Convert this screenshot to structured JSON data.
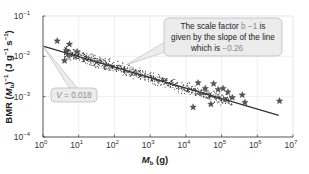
{
  "chart_data": {
    "type": "scatter",
    "title": "",
    "xlabel": "M_b (g)",
    "xlabel_parts": {
      "main": "M",
      "sub": "b",
      "unit": " (g)"
    },
    "ylabel": "BMR (M_b)^-1 (J g^-1 s^-1)",
    "ylabel_parts": {
      "a": "BMR (",
      "m": "M",
      "sub": "b",
      "b": ")",
      "exp1": "−1",
      "c": " (J g",
      "exp2": "−1",
      "d": " s",
      "exp3": "−1",
      "e": ")"
    },
    "x_scale": "log",
    "y_scale": "log",
    "xlim": [
      1,
      10000000
    ],
    "ylim": [
      0.0001,
      0.1
    ],
    "x_ticks": [
      {
        "base": "10",
        "exp": "0",
        "value": 1
      },
      {
        "base": "10",
        "exp": "1",
        "value": 10
      },
      {
        "base": "10",
        "exp": "2",
        "value": 100
      },
      {
        "base": "10",
        "exp": "3",
        "value": 1000
      },
      {
        "base": "10",
        "exp": "4",
        "value": 10000
      },
      {
        "base": "10",
        "exp": "5",
        "value": 100000
      },
      {
        "base": "10",
        "exp": "6",
        "value": 1000000
      },
      {
        "base": "10",
        "exp": "7",
        "value": 10000000
      }
    ],
    "y_ticks": [
      {
        "base": "10",
        "exp": "−1",
        "value": 0.1
      },
      {
        "base": "10",
        "exp": "−2",
        "value": 0.01
      },
      {
        "base": "10",
        "exp": "−3",
        "value": 0.001
      },
      {
        "base": "10",
        "exp": "−4",
        "value": 0.0001
      }
    ],
    "grid": true,
    "fit_line": {
      "V": 0.018,
      "slope": -0.26,
      "x_start": 1,
      "x_end": 4000000,
      "color": "#333333"
    },
    "series": [
      {
        "name": "species (dots)",
        "marker": "dot",
        "description": "dense cloud of ~1000 points following the fit line from ~4 g to ~2e5 g",
        "x_range": [
          4,
          200000
        ]
      },
      {
        "name": "highlighted species (stars)",
        "marker": "star",
        "points": [
          {
            "x": 2.5,
            "y": 0.024
          },
          {
            "x": 4,
            "y": 0.0078
          },
          {
            "x": 4.5,
            "y": 0.014
          },
          {
            "x": 5.5,
            "y": 0.02
          },
          {
            "x": 9,
            "y": 0.013
          },
          {
            "x": 16000,
            "y": 0.00055
          },
          {
            "x": 22000,
            "y": 0.0022
          },
          {
            "x": 35000,
            "y": 0.0016
          },
          {
            "x": 50000,
            "y": 0.00065
          },
          {
            "x": 60000,
            "y": 0.0021
          },
          {
            "x": 80000,
            "y": 0.0015
          },
          {
            "x": 110000,
            "y": 0.0016
          },
          {
            "x": 150000,
            "y": 0.0013
          },
          {
            "x": 200000,
            "y": 0.00095
          },
          {
            "x": 380000,
            "y": 0.0011
          },
          {
            "x": 450000,
            "y": 0.00072
          },
          {
            "x": 4200000,
            "y": 0.00078
          }
        ]
      }
    ],
    "annotations": [
      {
        "id": "scale-factor",
        "lines": [
          {
            "text": "The scale factor ",
            "highlight": "b −1",
            "tail": " is"
          },
          {
            "text": "given by the slope of the line"
          },
          {
            "text": "which is ",
            "highlight": "−0.26",
            "tail": ""
          }
        ],
        "points_to": {
          "x": 200,
          "y": 0.0054
        }
      },
      {
        "id": "intercept",
        "label_italic": "V",
        "label_rest": " = 0.018",
        "points_to": {
          "x": 1,
          "y": 0.018
        }
      }
    ],
    "legend": null
  }
}
